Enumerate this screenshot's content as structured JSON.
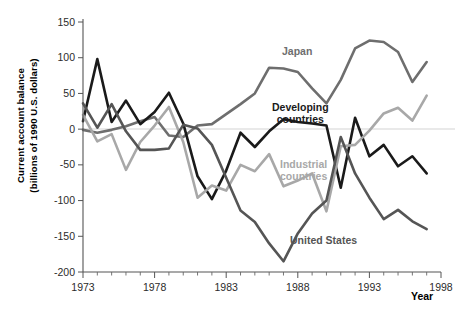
{
  "chart_data": {
    "type": "line",
    "title": "",
    "xlabel": "Year",
    "ylabel": "Current account balance\n(billions of 1990 U.S. dollars)",
    "ylabel_line1": "Current account balance",
    "ylabel_line2": "(billions of 1990 U.S. dollars)",
    "xlim": [
      1973,
      1998
    ],
    "ylim": [
      -200,
      150
    ],
    "xticks": [
      1973,
      1978,
      1983,
      1988,
      1993,
      1998
    ],
    "xtick_labels": [
      "1973",
      "1978",
      "1983",
      "1988",
      "1993",
      "1998"
    ],
    "xticks_minor_step": 1,
    "yticks": [
      -200,
      -150,
      -100,
      -50,
      0,
      50,
      100,
      150
    ],
    "ytick_labels": [
      "-200",
      "-150",
      "-100",
      "-50",
      "0",
      "50",
      "100",
      "150"
    ],
    "grid": false,
    "zero_line": true,
    "legend_position": "inline-annotations",
    "x": [
      1973,
      1974,
      1975,
      1976,
      1977,
      1978,
      1979,
      1980,
      1981,
      1982,
      1983,
      1984,
      1985,
      1986,
      1987,
      1988,
      1989,
      1990,
      1991,
      1992,
      1993,
      1994,
      1995,
      1996,
      1997
    ],
    "series": [
      {
        "name": "Japan",
        "color": "#6e6e6e",
        "values": [
          -1,
          -5,
          -1,
          4,
          11,
          17,
          -9,
          -11,
          5,
          7,
          21,
          35,
          50,
          86,
          85,
          80,
          57,
          36,
          69,
          113,
          124,
          122,
          108,
          66,
          94
        ]
      },
      {
        "name": "Developing countries",
        "color": "#1a1a1a",
        "values": [
          11,
          98,
          10,
          40,
          7,
          24,
          51,
          8,
          -66,
          -98,
          -58,
          -5,
          -25,
          -3,
          14,
          10,
          8,
          5,
          -82,
          16,
          -38,
          -22,
          -52,
          -38,
          -62
        ]
      },
      {
        "name": "Industrial countries",
        "color": "#a8a8a8",
        "values": [
          20,
          -17,
          -7,
          -57,
          -18,
          5,
          31,
          -18,
          -96,
          -79,
          -86,
          -50,
          -59,
          -35,
          -80,
          -72,
          -62,
          -115,
          -24,
          -22,
          -2,
          22,
          30,
          12,
          47
        ]
      },
      {
        "name": "United States",
        "color": "#555555",
        "values": [
          36,
          2,
          35,
          -3,
          -29,
          -29,
          -27,
          6,
          1,
          -22,
          -68,
          -114,
          -130,
          -160,
          -185,
          -146,
          -118,
          -100,
          -11,
          -62,
          -96,
          -126,
          -113,
          -129,
          -140
        ]
      }
    ],
    "annotations": [
      {
        "text": "Japan",
        "color": "#6e6e6e",
        "bold": true
      },
      {
        "text": "Developing\ncountries",
        "line1": "Developing",
        "line2": "countries",
        "color": "#111111",
        "bold": true
      },
      {
        "text": "Industrial\ncountries",
        "line1": "Industrial",
        "line2": "countries",
        "color": "#a8a8a8",
        "bold": true
      },
      {
        "text": "United States",
        "color": "#4a4a4a",
        "bold": true
      }
    ]
  },
  "labels": {
    "y_axis_line1": "Current account balance",
    "y_axis_line2": "(billions of 1990 U.S. dollars)",
    "x_axis_title": "Year",
    "japan": "Japan",
    "developing_line1": "Developing",
    "developing_line2": "countries",
    "industrial_line1": "Industrial",
    "industrial_line2": "countries",
    "united_states": "United States"
  },
  "ticks": {
    "x": [
      "1973",
      "1978",
      "1983",
      "1988",
      "1993",
      "1998"
    ],
    "y": [
      "150",
      "100",
      "50",
      "0",
      "-50",
      "-100",
      "-150",
      "-200"
    ]
  },
  "colors": {
    "japan": "#6e6e6e",
    "developing": "#1a1a1a",
    "industrial": "#a8a8a8",
    "united_states": "#555555",
    "axis": "#555555",
    "zero_line": "#e2e2e2",
    "text": "#000000"
  }
}
